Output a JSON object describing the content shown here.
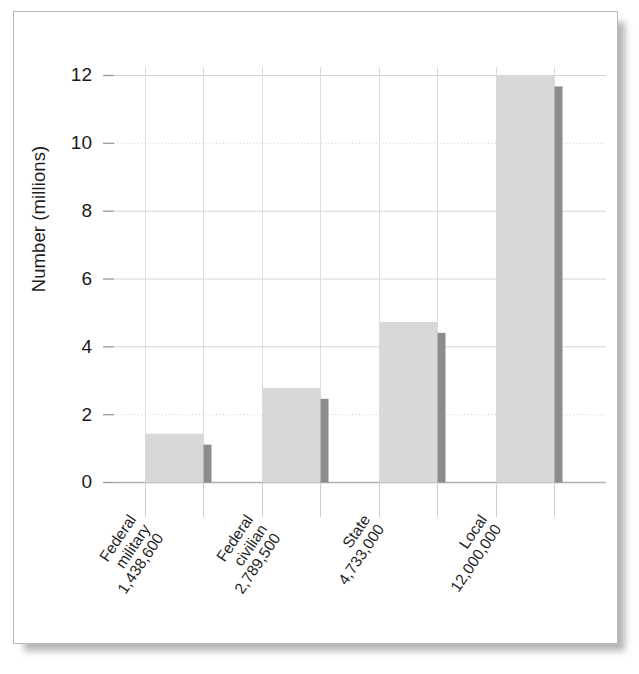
{
  "chart_data": {
    "type": "bar",
    "title": "",
    "subtitle": "",
    "xlabel": "",
    "ylabel": "Number (millions)",
    "ylim": [
      0,
      13
    ],
    "yticks": [
      0,
      2,
      4,
      6,
      8,
      10,
      12
    ],
    "ytick_labels": [
      "0",
      "2",
      "4",
      "6",
      "8",
      "10",
      "12"
    ],
    "grid": true,
    "legend": null,
    "categories": [
      "Federal military",
      "Federal civilian",
      "State",
      "Local"
    ],
    "category_lines": [
      [
        "Federal",
        "military",
        "1,438,600"
      ],
      [
        "Federal",
        "civilian",
        "2,789,500"
      ],
      [
        "State",
        "4,733,000"
      ],
      [
        "Local",
        "12,000,000"
      ]
    ],
    "value_labels": [
      "1,438,600",
      "2,789,500",
      "4,733,000",
      "12,000,000"
    ],
    "values": [
      1.4386,
      2.7895,
      4.733,
      12.0
    ],
    "bar_fill_color": "#d8d8d8",
    "bar_shadow_color": "#8c8c8c",
    "grid_color": "#d4d4d4",
    "axis_color": "#9a9a9a",
    "frame_color": "#b9b9b9",
    "text_color": "#1a1a1a"
  },
  "axis": {
    "y_title": "Number (millions)",
    "ticks": [
      {
        "label": "12",
        "value": 12
      },
      {
        "label": "10",
        "value": 10
      },
      {
        "label": "8",
        "value": 8
      },
      {
        "label": "6",
        "value": 6
      },
      {
        "label": "4",
        "value": 4
      },
      {
        "label": "2",
        "value": 2
      },
      {
        "label": "0",
        "value": 0
      }
    ]
  },
  "bars": [
    {
      "name": "federal-military",
      "l1": "Federal",
      "l2": "military",
      "l3": "1,438,600",
      "value": 1.4386
    },
    {
      "name": "federal-civilian",
      "l1": "Federal",
      "l2": "civilian",
      "l3": "2,789,500",
      "value": 2.7895
    },
    {
      "name": "state",
      "l1": "State",
      "l2": "4,733,000",
      "l3": "",
      "value": 4.733
    },
    {
      "name": "local",
      "l1": "Local",
      "l2": "12,000,000",
      "l3": "",
      "value": 12.0
    }
  ]
}
